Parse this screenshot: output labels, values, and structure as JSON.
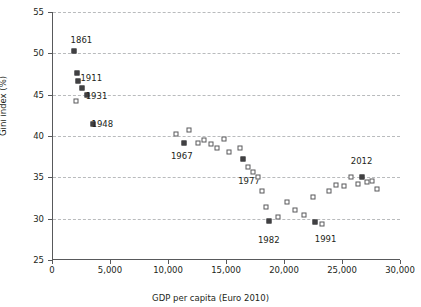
{
  "chart_data": {
    "type": "scatter",
    "title": "",
    "xlabel": "GDP per capita (Euro 2010)",
    "ylabel": "Gini index (%)",
    "xlim": [
      0,
      30000
    ],
    "ylim": [
      25,
      55
    ],
    "xticks": [
      0,
      5000,
      10000,
      15000,
      20000,
      25000,
      30000
    ],
    "xtick_labels": [
      "0",
      "5,000",
      "10,000",
      "15,000",
      "20,000",
      "25,000",
      "30,000"
    ],
    "yticks": [
      25,
      30,
      35,
      40,
      45,
      50,
      55
    ],
    "ytick_labels": [
      "25",
      "30",
      "35",
      "40",
      "45",
      "50",
      "55"
    ],
    "grid": "horizontal-dashed",
    "legend": "none",
    "marker_styles": {
      "open": "open square (white fill, dark outline)",
      "filled": "filled dark square"
    },
    "points": [
      {
        "x": 1850,
        "y": 50.3,
        "style": "filled",
        "label": "1861",
        "label_x": 2450,
        "label_y": 51.6
      },
      {
        "x": 2050,
        "y": 47.6,
        "style": "filled",
        "label": "",
        "label_x": null,
        "label_y": null
      },
      {
        "x": 2150,
        "y": 46.6,
        "style": "filled",
        "label": "",
        "label_x": null,
        "label_y": null
      },
      {
        "x": 2500,
        "y": 45.8,
        "style": "filled",
        "label": "1911",
        "label_x": 3300,
        "label_y": 47.0
      },
      {
        "x": 2000,
        "y": 44.2,
        "style": "open",
        "label": "",
        "label_x": null,
        "label_y": null
      },
      {
        "x": 2950,
        "y": 44.9,
        "style": "filled",
        "label": "1931",
        "label_x": 3750,
        "label_y": 44.8
      },
      {
        "x": 3450,
        "y": 41.5,
        "style": "filled",
        "label": "1948",
        "label_x": 4250,
        "label_y": 41.5
      },
      {
        "x": 10600,
        "y": 40.3,
        "style": "open",
        "label": "",
        "label_x": null,
        "label_y": null
      },
      {
        "x": 11300,
        "y": 39.1,
        "style": "filled",
        "label": "1967",
        "label_x": 11100,
        "label_y": 37.6
      },
      {
        "x": 11750,
        "y": 40.7,
        "style": "open",
        "label": "",
        "label_x": null,
        "label_y": null
      },
      {
        "x": 12500,
        "y": 39.2,
        "style": "open",
        "label": "",
        "label_x": null,
        "label_y": null
      },
      {
        "x": 13050,
        "y": 39.5,
        "style": "open",
        "label": "",
        "label_x": null,
        "label_y": null
      },
      {
        "x": 13600,
        "y": 39.0,
        "style": "open",
        "label": "",
        "label_x": null,
        "label_y": null
      },
      {
        "x": 14150,
        "y": 38.6,
        "style": "open",
        "label": "",
        "label_x": null,
        "label_y": null
      },
      {
        "x": 14700,
        "y": 39.6,
        "style": "open",
        "label": "",
        "label_x": null,
        "label_y": null
      },
      {
        "x": 15200,
        "y": 38.1,
        "style": "open",
        "label": "",
        "label_x": null,
        "label_y": null
      },
      {
        "x": 16100,
        "y": 38.6,
        "style": "open",
        "label": "",
        "label_x": null,
        "label_y": null
      },
      {
        "x": 16400,
        "y": 37.2,
        "style": "filled",
        "label": "1977",
        "label_x": 16900,
        "label_y": 34.5
      },
      {
        "x": 16850,
        "y": 36.3,
        "style": "open",
        "label": "",
        "label_x": null,
        "label_y": null
      },
      {
        "x": 17250,
        "y": 35.6,
        "style": "open",
        "label": "",
        "label_x": null,
        "label_y": null
      },
      {
        "x": 17700,
        "y": 35.0,
        "style": "open",
        "label": "",
        "label_x": null,
        "label_y": null
      },
      {
        "x": 18050,
        "y": 33.3,
        "style": "open",
        "label": "",
        "label_x": null,
        "label_y": null
      },
      {
        "x": 18350,
        "y": 31.4,
        "style": "open",
        "label": "",
        "label_x": null,
        "label_y": null
      },
      {
        "x": 18600,
        "y": 29.7,
        "style": "filled",
        "label": "1982",
        "label_x": 18600,
        "label_y": 27.4
      },
      {
        "x": 19400,
        "y": 30.2,
        "style": "open",
        "label": "",
        "label_x": null,
        "label_y": null
      },
      {
        "x": 20200,
        "y": 32.0,
        "style": "open",
        "label": "",
        "label_x": null,
        "label_y": null
      },
      {
        "x": 20900,
        "y": 31.0,
        "style": "open",
        "label": "",
        "label_x": null,
        "label_y": null
      },
      {
        "x": 21600,
        "y": 30.4,
        "style": "open",
        "label": "",
        "label_x": null,
        "label_y": null
      },
      {
        "x": 22450,
        "y": 32.6,
        "style": "open",
        "label": "",
        "label_x": null,
        "label_y": null
      },
      {
        "x": 22600,
        "y": 29.6,
        "style": "filled",
        "label": "1991",
        "label_x": 23500,
        "label_y": 27.6
      },
      {
        "x": 23200,
        "y": 29.3,
        "style": "open",
        "label": "",
        "label_x": null,
        "label_y": null
      },
      {
        "x": 23800,
        "y": 33.4,
        "style": "open",
        "label": "",
        "label_x": null,
        "label_y": null
      },
      {
        "x": 24400,
        "y": 34.1,
        "style": "open",
        "label": "",
        "label_x": null,
        "label_y": null
      },
      {
        "x": 25100,
        "y": 34.0,
        "style": "open",
        "label": "",
        "label_x": null,
        "label_y": null
      },
      {
        "x": 25700,
        "y": 35.1,
        "style": "open",
        "label": "",
        "label_x": null,
        "label_y": null
      },
      {
        "x": 26250,
        "y": 34.2,
        "style": "open",
        "label": "",
        "label_x": null,
        "label_y": null
      },
      {
        "x": 26600,
        "y": 35.0,
        "style": "filled",
        "label": "2012",
        "label_x": 26600,
        "label_y": 37.0
      },
      {
        "x": 27100,
        "y": 34.4,
        "style": "open",
        "label": "",
        "label_x": null,
        "label_y": null
      },
      {
        "x": 27500,
        "y": 34.6,
        "style": "open",
        "label": "",
        "label_x": null,
        "label_y": null
      },
      {
        "x": 27900,
        "y": 33.6,
        "style": "open",
        "label": "",
        "label_x": null,
        "label_y": null
      }
    ]
  },
  "colors": {
    "axis": "#58595b",
    "grid": "#b9bbbd",
    "marker_fill": "#414042",
    "text": "#231f20",
    "background": "#ffffff"
  }
}
